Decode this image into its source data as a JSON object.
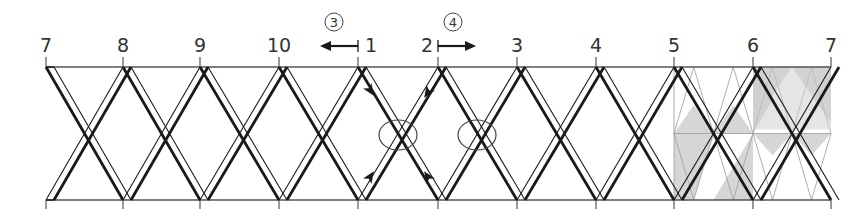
{
  "diagram": {
    "type": "braided-strap-lacing-diagram",
    "top_labels": [
      "7",
      "8",
      "9",
      "10",
      "1",
      "2",
      "3",
      "4",
      "5",
      "6",
      "7"
    ],
    "label_x": [
      46,
      123,
      200,
      279,
      358,
      438,
      517,
      596,
      674,
      753,
      831
    ],
    "top_border_y": 67,
    "bottom_border_y": 200,
    "direction_markers": [
      {
        "id": "3",
        "symbol": "③",
        "direction": "left",
        "anchor_label": "1"
      },
      {
        "id": "4",
        "symbol": "④",
        "direction": "right",
        "anchor_label": "2"
      }
    ],
    "highlight_circles": [
      {
        "cx": 398,
        "cy": 135,
        "rx": 19,
        "ry": 15
      },
      {
        "cx": 477,
        "cy": 135,
        "rx": 19,
        "ry": 15
      }
    ],
    "flow_arrows": [
      {
        "x": 370,
        "y": 90,
        "dir": "down-right"
      },
      {
        "x": 428,
        "y": 92,
        "dir": "down-left"
      },
      {
        "x": 370,
        "y": 177,
        "dir": "up-right"
      },
      {
        "x": 428,
        "y": 177,
        "dir": "up-left"
      }
    ],
    "shaded_region": {
      "from_label_index": 8,
      "to_label_index": 10,
      "color": "#c8c8c8"
    },
    "colors": {
      "stroke": "#1a1a1a",
      "border": "#555555",
      "shade": "#cfcfcf",
      "pattern_line": "#9a9a9a"
    }
  }
}
